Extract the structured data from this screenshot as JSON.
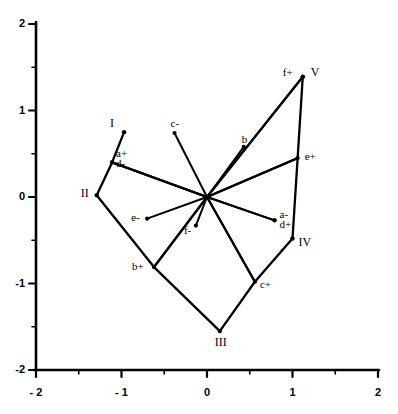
{
  "chart_data": {
    "type": "scatter",
    "title": "",
    "xlabel": "",
    "ylabel": "",
    "xlim": [
      -2,
      2
    ],
    "ylim": [
      -2,
      2
    ],
    "xticks": [
      -2,
      -1,
      0,
      1,
      2
    ],
    "yticks": [
      -2,
      -1,
      0,
      1,
      2
    ],
    "xticklabels": [
      "- 2",
      "- 1",
      "0",
      "1",
      "2"
    ],
    "yticklabels": [
      "-2",
      "-1",
      "0",
      "1",
      "2"
    ],
    "minor_tick_step": 0.5,
    "grid": false,
    "legend": null,
    "origin": [
      0,
      0
    ],
    "vectors": [
      {
        "label": "a+",
        "x": -1.11,
        "y": 0.4
      },
      {
        "label": "d-",
        "x": -1.11,
        "y": 0.4
      },
      {
        "label": "a-",
        "x": 0.79,
        "y": -0.27
      },
      {
        "label": "d+",
        "x": 0.79,
        "y": -0.27
      },
      {
        "label": "b",
        "x": 0.43,
        "y": 0.58
      },
      {
        "label": "b+",
        "x": -0.62,
        "y": -0.81
      },
      {
        "label": "c-",
        "x": -0.38,
        "y": 0.74
      },
      {
        "label": "c+",
        "x": 0.56,
        "y": -0.98
      },
      {
        "label": "e+",
        "x": 1.06,
        "y": 0.45
      },
      {
        "label": "e-",
        "x": -0.7,
        "y": -0.25
      },
      {
        "label": "f+",
        "x": 1.12,
        "y": 1.39
      },
      {
        "label": "f-",
        "x": -0.13,
        "y": -0.33
      }
    ],
    "polygon": {
      "label_prefix": "region",
      "vertices": [
        {
          "label": "I",
          "x": -0.97,
          "y": 0.75
        },
        {
          "label": "II",
          "x": -1.29,
          "y": 0.02
        },
        {
          "label": "III",
          "x": 0.15,
          "y": -1.55
        },
        {
          "label": "IV",
          "x": 1.0,
          "y": -0.48
        },
        {
          "label": "V",
          "x": 1.12,
          "y": 1.39
        }
      ]
    },
    "segments": [
      {
        "from": "I-tip",
        "to": "a+d-"
      },
      {
        "from": "a+d-",
        "to": "II"
      },
      {
        "from": "a+d-",
        "to": "origin"
      },
      {
        "from": "II",
        "to": "b+"
      },
      {
        "from": "b+",
        "to": "III"
      },
      {
        "from": "b+",
        "to": "origin"
      },
      {
        "from": "III",
        "to": "c+"
      },
      {
        "from": "c+",
        "to": "IV"
      },
      {
        "from": "c+",
        "to": "origin"
      },
      {
        "from": "IV",
        "to": "e+"
      },
      {
        "from": "e+",
        "to": "origin"
      },
      {
        "from": "e+",
        "to": "V"
      },
      {
        "from": "V",
        "to": "origin"
      }
    ]
  },
  "axis_labels": {
    "x": [
      "- 2",
      "- 1",
      "0",
      "1",
      "2"
    ],
    "y": [
      "2",
      "1",
      "0",
      "-1",
      "-2"
    ]
  },
  "point_labels": {
    "a_plus": "a+",
    "a_minus": "a-",
    "b": "b",
    "b_plus": "b+",
    "c_minus": "c-",
    "c_plus": "c+",
    "d_minus": "d-",
    "d_plus": "d+",
    "e_plus": "e+",
    "e_minus": "e-",
    "f_plus": "f+",
    "f_minus": "f-",
    "I": "I",
    "II": "II",
    "III": "III",
    "IV": "IV",
    "V": "V"
  },
  "colors": {
    "line": "#000000",
    "background": "#ffffff",
    "text": "#000000"
  }
}
